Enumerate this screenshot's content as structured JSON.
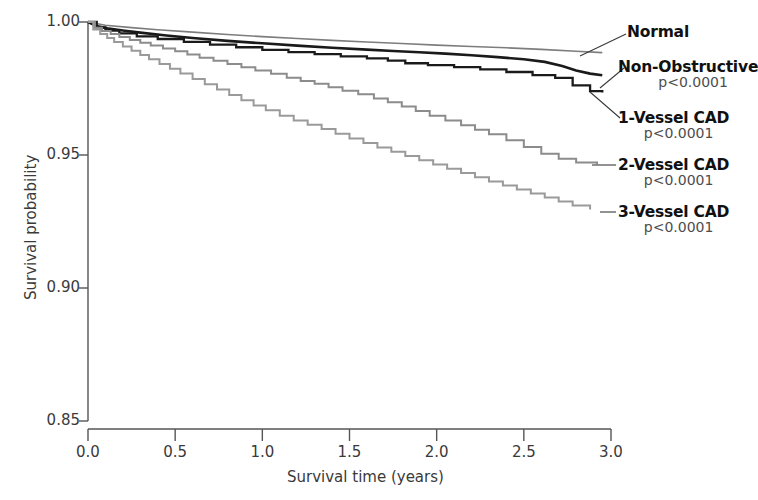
{
  "chart_data": {
    "type": "line",
    "title": "",
    "xlabel": "Survival time (years)",
    "ylabel": "Survival probability",
    "xlim": [
      0.0,
      3.0
    ],
    "ylim": [
      0.85,
      1.0
    ],
    "xticks": [
      "0.0",
      "0.5",
      "1.0",
      "1.5",
      "2.0",
      "2.5",
      "3.0"
    ],
    "xtick_values": [
      0.0,
      0.5,
      1.0,
      1.5,
      2.0,
      2.5,
      3.0
    ],
    "yticks": [
      "1.00",
      "0.95",
      "0.90",
      "0.85"
    ],
    "ytick_values": [
      1.0,
      0.95,
      0.9,
      0.85
    ],
    "grid": false,
    "legend_position": "right-inline-labels",
    "step_style": "post",
    "series": [
      {
        "name": "Normal",
        "label": "Normal",
        "pvalue": "",
        "color": "#7d7d7d",
        "width": 1.6,
        "end_value": 0.9885,
        "x": [
          0.0,
          0.1,
          0.25,
          0.4,
          0.6,
          0.8,
          1.0,
          1.2,
          1.4,
          1.6,
          1.8,
          2.0,
          2.2,
          2.4,
          2.6,
          2.8,
          2.95
        ],
        "y": [
          1.0,
          0.9988,
          0.9979,
          0.9971,
          0.9962,
          0.9953,
          0.9945,
          0.9938,
          0.9931,
          0.9925,
          0.9919,
          0.9913,
          0.9908,
          0.9903,
          0.9897,
          0.989,
          0.9885
        ]
      },
      {
        "name": "Non-Obstructive",
        "label": "Non-Obstructive",
        "pvalue": "p<0.0001",
        "color": "#1a1a1a",
        "width": 2.6,
        "end_value": 0.98,
        "x": [
          0.0,
          0.05,
          0.12,
          0.2,
          0.3,
          0.45,
          0.6,
          0.8,
          1.0,
          1.2,
          1.4,
          1.6,
          1.75,
          1.9,
          2.05,
          2.2,
          2.35,
          2.5,
          2.62,
          2.72,
          2.8,
          2.88,
          2.95
        ],
        "y": [
          1.0,
          0.9985,
          0.9975,
          0.9968,
          0.996,
          0.9949,
          0.994,
          0.9929,
          0.992,
          0.9911,
          0.9903,
          0.9896,
          0.9891,
          0.9886,
          0.9881,
          0.9875,
          0.9868,
          0.986,
          0.985,
          0.9835,
          0.9818,
          0.9806,
          0.98
        ]
      },
      {
        "name": "1-Vessel CAD",
        "label": "1-Vessel CAD",
        "pvalue": "p<0.0001",
        "color": "#1a1a1a",
        "width": 2.3,
        "end_value": 0.9735,
        "x": [
          0.0,
          0.05,
          0.1,
          0.18,
          0.28,
          0.4,
          0.55,
          0.7,
          0.85,
          1.0,
          1.15,
          1.3,
          1.45,
          1.6,
          1.72,
          1.82,
          1.95,
          2.1,
          2.25,
          2.4,
          2.55,
          2.68,
          2.78,
          2.88,
          2.95
        ],
        "y": [
          1.0,
          0.998,
          0.9968,
          0.9957,
          0.9946,
          0.9936,
          0.9925,
          0.9915,
          0.9905,
          0.9895,
          0.9887,
          0.9879,
          0.9871,
          0.9863,
          0.9855,
          0.9845,
          0.9838,
          0.983,
          0.9822,
          0.9812,
          0.98,
          0.979,
          0.9762,
          0.974,
          0.9735
        ]
      },
      {
        "name": "2-Vessel CAD",
        "label": "2-Vessel CAD",
        "pvalue": "p<0.0001",
        "color": "#8c8c8c",
        "width": 2.0,
        "end_value": 0.9465,
        "x": [
          0.0,
          0.04,
          0.08,
          0.13,
          0.18,
          0.24,
          0.3,
          0.36,
          0.43,
          0.5,
          0.57,
          0.64,
          0.72,
          0.8,
          0.88,
          0.96,
          1.05,
          1.14,
          1.22,
          1.3,
          1.38,
          1.46,
          1.55,
          1.64,
          1.72,
          1.8,
          1.88,
          1.96,
          2.05,
          2.14,
          2.22,
          2.3,
          2.4,
          2.5,
          2.6,
          2.7,
          2.8,
          2.92
        ],
        "y": [
          1.0,
          0.9978,
          0.9966,
          0.9955,
          0.9944,
          0.9932,
          0.9922,
          0.9912,
          0.99,
          0.989,
          0.9878,
          0.9866,
          0.9854,
          0.9842,
          0.983,
          0.9818,
          0.9805,
          0.979,
          0.9778,
          0.9768,
          0.9755,
          0.9742,
          0.9728,
          0.9712,
          0.9698,
          0.9682,
          0.9665,
          0.9648,
          0.963,
          0.9612,
          0.9595,
          0.9578,
          0.9555,
          0.953,
          0.9505,
          0.9486,
          0.9472,
          0.9465
        ]
      },
      {
        "name": "3-Vessel CAD",
        "label": "3-Vessel CAD",
        "pvalue": "p<0.0001",
        "color": "#9a9a9a",
        "width": 2.0,
        "end_value": 0.9295,
        "x": [
          0.0,
          0.03,
          0.07,
          0.11,
          0.15,
          0.2,
          0.25,
          0.3,
          0.35,
          0.41,
          0.47,
          0.53,
          0.6,
          0.67,
          0.74,
          0.81,
          0.88,
          0.95,
          1.02,
          1.1,
          1.18,
          1.26,
          1.34,
          1.42,
          1.5,
          1.58,
          1.66,
          1.74,
          1.82,
          1.9,
          1.98,
          2.06,
          2.14,
          2.22,
          2.3,
          2.38,
          2.46,
          2.54,
          2.62,
          2.7,
          2.78,
          2.88
        ],
        "y": [
          1.0,
          0.9972,
          0.9955,
          0.994,
          0.9925,
          0.9908,
          0.9892,
          0.9876,
          0.986,
          0.9842,
          0.9824,
          0.9806,
          0.9786,
          0.9766,
          0.9746,
          0.9726,
          0.9706,
          0.9686,
          0.9668,
          0.9648,
          0.963,
          0.9614,
          0.9598,
          0.958,
          0.9562,
          0.9545,
          0.9528,
          0.9512,
          0.9496,
          0.948,
          0.9464,
          0.9448,
          0.9432,
          0.9416,
          0.94,
          0.9385,
          0.937,
          0.9355,
          0.934,
          0.9325,
          0.931,
          0.9295
        ]
      }
    ]
  },
  "labels": {
    "normal": "Normal",
    "non_obstructive": "Non-Obstructive",
    "one_vessel": "1-Vessel CAD",
    "two_vessel": "2-Vessel CAD",
    "three_vessel": "3-Vessel CAD",
    "p_non_obstructive": "p<0.0001",
    "p_one_vessel": "p<0.0001",
    "p_two_vessel": "p<0.0001",
    "p_three_vessel": "p<0.0001"
  },
  "axes": {
    "x_title": "Survival time (years)",
    "y_title": "Survival probability",
    "x_ticks": [
      "0.0",
      "0.5",
      "1.0",
      "1.5",
      "2.0",
      "2.5",
      "3.0"
    ],
    "y_ticks": [
      "1.00",
      "0.95",
      "0.90",
      "0.85"
    ]
  },
  "colors": {
    "axis": "#555555",
    "normal": "#7d7d7d",
    "non_obstructive": "#1a1a1a",
    "one_vessel": "#1a1a1a",
    "two_vessel": "#8c8c8c",
    "three_vessel": "#9a9a9a",
    "label_text": "#111111",
    "p_text": "#4d4d4d"
  }
}
